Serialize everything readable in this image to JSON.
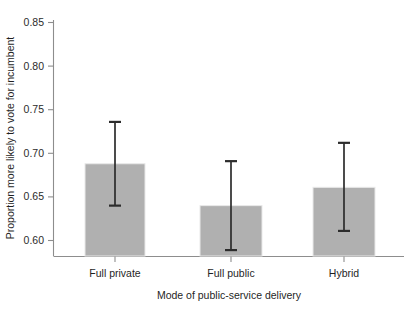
{
  "chart_data": {
    "type": "bar",
    "title": "",
    "subtitle": "",
    "xlabel": "Mode of public-service delivery",
    "ylabel": "Proportion more likely to vote for incumbent",
    "categories": [
      "Full private",
      "Full public",
      "Hybrid"
    ],
    "values": [
      0.688,
      0.64,
      0.661
    ],
    "error_low": [
      0.64,
      0.589,
      0.611
    ],
    "error_high": [
      0.736,
      0.691,
      0.712
    ],
    "ylim": [
      0.589,
      0.858
    ],
    "yticks": [
      0.6,
      0.65,
      0.7,
      0.75,
      0.8,
      0.85
    ],
    "ytick_labels": [
      "0.60",
      "0.65",
      "0.70",
      "0.75",
      "0.80",
      "0.85"
    ],
    "grid": false,
    "legend": "none",
    "bar_color": "#b0b0b0",
    "bar_edge_color": "#e9e9e9",
    "error_bar_color": "#2c2c2c",
    "axis_color": "#8d8d8d",
    "background_color": "#ffffff",
    "bars_clipped_at_baseline": true,
    "series": [
      {
        "name": "Proportion more likely to vote for incumbent",
        "values": [
          0.688,
          0.64,
          0.661
        ],
        "error_low": [
          0.64,
          0.589,
          0.611
        ],
        "error_high": [
          0.736,
          0.691,
          0.712
        ]
      }
    ]
  },
  "figure": {
    "width": 414,
    "height": 309
  }
}
